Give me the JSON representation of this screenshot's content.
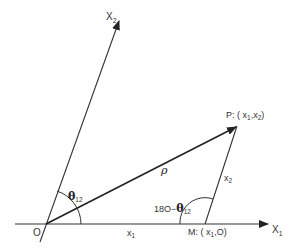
{
  "diagram": {
    "type": "vector-coordinate-geometry",
    "axes": {
      "x1": {
        "label": "X",
        "subscript": "1"
      },
      "x2": {
        "label": "X",
        "subscript": "2"
      }
    },
    "points": {
      "origin": {
        "label": "O"
      },
      "p": {
        "label": "P: ( x",
        "sub1": "1",
        "mid": ",x",
        "sub2": "2",
        "end": ")"
      },
      "m": {
        "label": "M: ( x",
        "sub1": "1",
        "end": ",O)"
      }
    },
    "segments": {
      "rho": {
        "label": "ρ"
      },
      "pm": {
        "label": "x",
        "subscript": "2"
      },
      "om": {
        "label": "x",
        "subscript": "1"
      }
    },
    "angles": {
      "theta": {
        "symbol": "θ",
        "subscript": "12"
      },
      "supplement": {
        "prefix": "18O−",
        "symbol": "θ",
        "subscript": "12"
      }
    },
    "colors": {
      "line": "#333333",
      "background": "#ffffff"
    }
  }
}
